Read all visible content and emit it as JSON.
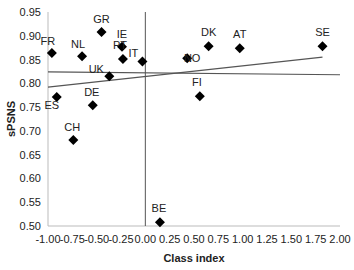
{
  "chart_data": {
    "type": "scatter",
    "title": "",
    "xlabel": "Class index",
    "ylabel": "sPSNS",
    "xlim": [
      -1.0,
      2.0
    ],
    "ylim": [
      0.5,
      0.95
    ],
    "x_ticks": [
      "-1.00",
      "-0.75",
      "-0.50",
      "-0.25",
      "0.00",
      "0.25",
      "0.50",
      "0.75",
      "1.00",
      "1.25",
      "1.50",
      "1.75",
      "2.00"
    ],
    "y_ticks": [
      "0.50",
      "0.55",
      "0.60",
      "0.65",
      "0.70",
      "0.75",
      "0.80",
      "0.85",
      "0.90",
      "0.95"
    ],
    "grid": false,
    "legend": null,
    "marker": "diamond",
    "marker_color": "#000000",
    "points": [
      {
        "label": "FR",
        "x": -0.96,
        "y": 0.864
      },
      {
        "label": "NL",
        "x": -0.65,
        "y": 0.857
      },
      {
        "label": "GR",
        "x": -0.45,
        "y": 0.908
      },
      {
        "label": "IE",
        "x": -0.24,
        "y": 0.877
      },
      {
        "label": "PT",
        "x": -0.23,
        "y": 0.851
      },
      {
        "label": "UK",
        "x": -0.37,
        "y": 0.815
      },
      {
        "label": "IT",
        "x": -0.03,
        "y": 0.846
      },
      {
        "label": "ES",
        "x": -0.91,
        "y": 0.771
      },
      {
        "label": "DE",
        "x": -0.54,
        "y": 0.754
      },
      {
        "label": "CH",
        "x": -0.74,
        "y": 0.681
      },
      {
        "label": "BE",
        "x": 0.15,
        "y": 0.508
      },
      {
        "label": "NO",
        "x": 0.43,
        "y": 0.853
      },
      {
        "label": "FI",
        "x": 0.56,
        "y": 0.773
      },
      {
        "label": "DK",
        "x": 0.65,
        "y": 0.878
      },
      {
        "label": "AT",
        "x": 0.97,
        "y": 0.874
      },
      {
        "label": "SE",
        "x": 1.82,
        "y": 0.878
      }
    ],
    "reference_lines": [
      {
        "name": "mean-line",
        "x1": -1.0,
        "y1": 0.824,
        "x2": 2.0,
        "y2": 0.818
      },
      {
        "name": "trend-line",
        "x1": -1.0,
        "y1": 0.792,
        "x2": 1.82,
        "y2": 0.855
      },
      {
        "name": "vertical-zero-line",
        "x": 0.0
      }
    ]
  }
}
